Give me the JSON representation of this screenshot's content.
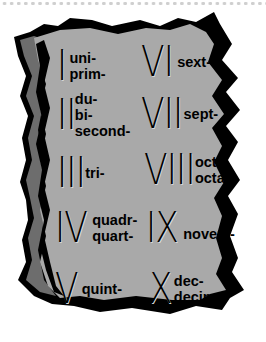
{
  "colors": {
    "tablet_face": "#a9a9a9",
    "tablet_side": "#6d6d6d",
    "outline": "#000000",
    "dots": "#cfcfcf"
  },
  "entries": [
    {
      "numeral": "I",
      "prefixes": [
        "uni-",
        "prim-"
      ]
    },
    {
      "numeral": "II",
      "prefixes": [
        "du-",
        "bi-",
        "second-"
      ]
    },
    {
      "numeral": "III",
      "prefixes": [
        "tri-"
      ]
    },
    {
      "numeral": "IV",
      "prefixes": [
        "quadr-",
        "quart-"
      ]
    },
    {
      "numeral": "V",
      "prefixes": [
        "quint-"
      ]
    },
    {
      "numeral": "VI",
      "prefixes": [
        "sext-"
      ]
    },
    {
      "numeral": "VII",
      "prefixes": [
        "sept-"
      ]
    },
    {
      "numeral": "VIII",
      "prefixes": [
        "oct-",
        "octav-"
      ]
    },
    {
      "numeral": "IX",
      "prefixes": [
        "novem-"
      ]
    },
    {
      "numeral": "X",
      "prefixes": [
        "dec-",
        "decim-"
      ]
    }
  ]
}
